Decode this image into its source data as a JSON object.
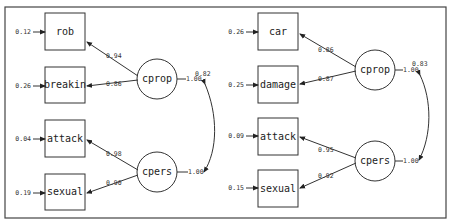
{
  "left_model": {
    "latents": [
      {
        "id": "cprop",
        "label": "cprop",
        "variance_label": "1.00"
      },
      {
        "id": "cpers",
        "label": "cpers",
        "variance_label": "1.00"
      }
    ],
    "indicators": [
      {
        "label": "rob",
        "error": "0.12",
        "loading": "0.94",
        "factor": "cprop"
      },
      {
        "label": "breakin",
        "error": "0.26",
        "loading": "0.86",
        "factor": "cprop"
      },
      {
        "label": "attack",
        "error": "0.04",
        "loading": "0.98",
        "factor": "cpers"
      },
      {
        "label": "sexual",
        "error": "0.19",
        "loading": "0.90",
        "factor": "cpers"
      }
    ],
    "correlation": "0.82"
  },
  "right_model": {
    "latents": [
      {
        "id": "cprop",
        "label": "cprop",
        "variance_label": "1.00"
      },
      {
        "id": "cpers",
        "label": "cpers",
        "variance_label": "1.00"
      }
    ],
    "indicators": [
      {
        "label": "car",
        "error": "0.26",
        "loading": "0.86",
        "factor": "cprop"
      },
      {
        "label": "damage",
        "error": "0.25",
        "loading": "0.87",
        "factor": "cprop"
      },
      {
        "label": "attack",
        "error": "0.09",
        "loading": "0.95",
        "factor": "cpers"
      },
      {
        "label": "sexual",
        "error": "0.15",
        "loading": "0.92",
        "factor": "cpers"
      }
    ],
    "correlation": "0.83"
  }
}
